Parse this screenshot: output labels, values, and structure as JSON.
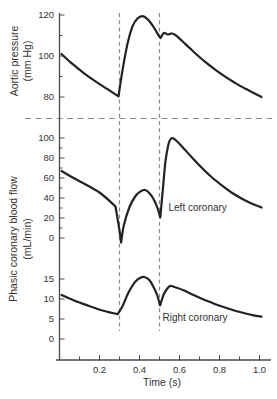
{
  "colors": {
    "curve": "#222222",
    "axis": "#4a4a4a",
    "dashed": "#8c8c8c",
    "text": "#333333"
  },
  "chart_data": {
    "type": "line",
    "title": "",
    "xlabel": "Time (s)",
    "x_axis": {
      "range": [
        0,
        1.05
      ],
      "major_ticks": [
        {
          "v": 0.2,
          "label": "0.2"
        },
        {
          "v": 0.4,
          "label": "0.4"
        },
        {
          "v": 0.6,
          "label": "0.6"
        },
        {
          "v": 0.8,
          "label": "0.8"
        },
        {
          "v": 1.0,
          "label": "1.0"
        }
      ],
      "minor_ticks": [
        0.1,
        0.3,
        0.5,
        0.7,
        0.9
      ]
    },
    "event_marker_times": [
      0.3,
      0.5
    ],
    "shared_ylabel_line1": "Phasic coronary blood flow",
    "shared_ylabel_line2": "(mL/min)",
    "panels": [
      {
        "name": "aortic-pressure",
        "ylabel_line1": "Aortic pressure",
        "ylabel_line2": "(mm Hg)",
        "ylim": [
          78,
          122
        ],
        "major_ticks": [
          {
            "v": 80,
            "label": "80"
          },
          {
            "v": 100,
            "label": "100"
          },
          {
            "v": 120,
            "label": "120"
          }
        ],
        "minor_ticks": [
          90,
          110
        ],
        "series_name": "Aortic pressure",
        "segments": [
          [
            [
              0.01,
              101
            ],
            [
              0.06,
              96.5
            ],
            [
              0.12,
              91.8
            ],
            [
              0.18,
              87.6
            ],
            [
              0.24,
              83.8
            ],
            [
              0.295,
              80.3
            ]
          ],
          [
            [
              0.295,
              80.3
            ],
            [
              0.315,
              93
            ],
            [
              0.34,
              106
            ],
            [
              0.365,
              114.5
            ],
            [
              0.39,
              118.3
            ],
            [
              0.415,
              119.4
            ],
            [
              0.44,
              118
            ],
            [
              0.465,
              115
            ],
            [
              0.487,
              111.4
            ],
            [
              0.505,
              108.8
            ]
          ],
          [
            [
              0.505,
              108.8
            ],
            [
              0.522,
              111.2
            ],
            [
              0.542,
              110.5
            ],
            [
              0.563,
              111
            ],
            [
              0.585,
              109.8
            ],
            [
              0.63,
              105.8
            ],
            [
              0.68,
              101.2
            ],
            [
              0.73,
              97
            ],
            [
              0.78,
              93.2
            ],
            [
              0.83,
              89.8
            ],
            [
              0.88,
              86.8
            ],
            [
              0.93,
              84
            ],
            [
              0.97,
              82
            ],
            [
              1.01,
              80
            ]
          ]
        ]
      },
      {
        "name": "left-coronary-flow",
        "ylim": [
          -8,
          105
        ],
        "major_ticks": [
          {
            "v": 0,
            "label": "0"
          },
          {
            "v": 20,
            "label": "20"
          },
          {
            "v": 40,
            "label": "40"
          },
          {
            "v": 60,
            "label": "60"
          },
          {
            "v": 80,
            "label": "80"
          },
          {
            "v": 100,
            "label": "100"
          }
        ],
        "minor_ticks": [
          10,
          30,
          50,
          70,
          90
        ],
        "series_name": "Left coronary",
        "annotation": "Left coronary",
        "annotation_pos": {
          "t": 0.545,
          "v": 27
        },
        "segments": [
          [
            [
              0.01,
              67
            ],
            [
              0.07,
              60
            ],
            [
              0.14,
              52.5
            ],
            [
              0.21,
              44
            ],
            [
              0.28,
              31.5
            ]
          ],
          [
            [
              0.28,
              31.5
            ],
            [
              0.298,
              10
            ],
            [
              0.308,
              -4.5
            ]
          ],
          [
            [
              0.308,
              -4.5
            ],
            [
              0.322,
              13
            ],
            [
              0.35,
              31
            ],
            [
              0.38,
              42
            ],
            [
              0.405,
              46.5
            ],
            [
              0.428,
              48
            ],
            [
              0.45,
              44.8
            ],
            [
              0.47,
              39
            ],
            [
              0.49,
              30
            ],
            [
              0.504,
              20.5
            ]
          ],
          [
            [
              0.504,
              20.5
            ],
            [
              0.516,
              47
            ],
            [
              0.53,
              77
            ],
            [
              0.545,
              94
            ],
            [
              0.558,
              99.5
            ],
            [
              0.575,
              98.8
            ],
            [
              0.61,
              92
            ],
            [
              0.66,
              81
            ],
            [
              0.71,
              70.5
            ],
            [
              0.76,
              61
            ],
            [
              0.81,
              52.8
            ],
            [
              0.86,
              45.5
            ],
            [
              0.91,
              39.5
            ],
            [
              0.96,
              34.5
            ],
            [
              1.01,
              30.5
            ]
          ]
        ]
      },
      {
        "name": "right-coronary-flow",
        "ylim": [
          -1,
          17
        ],
        "major_ticks": [
          {
            "v": 0,
            "label": "0"
          },
          {
            "v": 5,
            "label": "5"
          },
          {
            "v": 10,
            "label": "10"
          },
          {
            "v": 15,
            "label": "15"
          }
        ],
        "minor_ticks": [],
        "series_name": "Right coronary",
        "annotation": "Right coronary",
        "annotation_pos": {
          "t": 0.515,
          "v": 4.5
        },
        "segments": [
          [
            [
              0.01,
              11
            ],
            [
              0.07,
              9.7
            ],
            [
              0.14,
              8.4
            ],
            [
              0.21,
              7.2
            ],
            [
              0.29,
              6.2
            ]
          ],
          [
            [
              0.29,
              6.2
            ],
            [
              0.315,
              8.2
            ],
            [
              0.345,
              11.6
            ],
            [
              0.375,
              14.1
            ],
            [
              0.4,
              15.2
            ],
            [
              0.425,
              15.5
            ],
            [
              0.45,
              14.7
            ],
            [
              0.47,
              13
            ],
            [
              0.488,
              11
            ],
            [
              0.503,
              8.4
            ]
          ],
          [
            [
              0.503,
              8.4
            ],
            [
              0.52,
              11
            ],
            [
              0.54,
              12.7
            ],
            [
              0.555,
              13.3
            ],
            [
              0.575,
              13
            ],
            [
              0.62,
              12.2
            ],
            [
              0.67,
              11
            ],
            [
              0.72,
              9.9
            ],
            [
              0.77,
              8.9
            ],
            [
              0.82,
              8
            ],
            [
              0.87,
              7.2
            ],
            [
              0.92,
              6.5
            ],
            [
              0.97,
              5.9
            ],
            [
              1.01,
              5.6
            ]
          ]
        ]
      }
    ]
  }
}
